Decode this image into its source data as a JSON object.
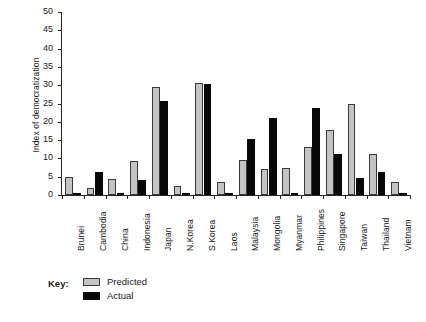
{
  "chart_data": {
    "type": "bar",
    "title": "",
    "xlabel": "",
    "ylabel": "Index of democratization",
    "ylim": [
      0,
      50
    ],
    "ytick_step": 5,
    "yticks": [
      0,
      5,
      10,
      15,
      20,
      25,
      30,
      35,
      40,
      45,
      50
    ],
    "grid": false,
    "legend_position": "below-left",
    "categories": [
      "Brunei",
      "Cambodia",
      "China",
      "Indonesia",
      "Japan",
      "N.Korea",
      "S.Korea",
      "Laos",
      "Malaysia",
      "Mongolia",
      "Myanmar",
      "Philippines",
      "Singapore",
      "Taiwan",
      "Thailand",
      "Vietnam"
    ],
    "series": [
      {
        "name": "Predicted",
        "color": "#c4c4c4",
        "values": [
          4.8,
          2.0,
          4.5,
          9.4,
          29.5,
          2.5,
          30.5,
          3.5,
          9.7,
          7.0,
          7.5,
          13.0,
          17.9,
          24.9,
          11.3,
          3.5
        ]
      },
      {
        "name": "Actual",
        "color": "#080808",
        "values": [
          0.2,
          6.2,
          0.2,
          4.2,
          25.8,
          0.2,
          30.2,
          0.2,
          15.2,
          21.0,
          0.3,
          23.8,
          11.3,
          4.6,
          6.3,
          0.2
        ]
      }
    ]
  },
  "legend": {
    "title": "Key:",
    "entries": [
      {
        "label": "Predicted",
        "swatch": "predicted"
      },
      {
        "label": "Actual",
        "swatch": "actual"
      }
    ]
  }
}
